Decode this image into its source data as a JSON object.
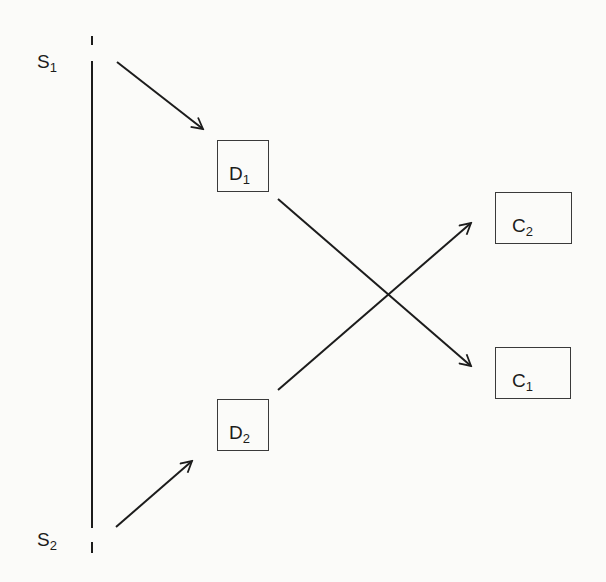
{
  "diagram": {
    "sources": [
      {
        "id": "S1",
        "letter": "S",
        "sub": "1"
      },
      {
        "id": "S2",
        "letter": "S",
        "sub": "2"
      }
    ],
    "detectors": [
      {
        "id": "D1",
        "letter": "D",
        "sub": "1"
      },
      {
        "id": "D2",
        "letter": "D",
        "sub": "2"
      }
    ],
    "counters": [
      {
        "id": "C2",
        "letter": "C",
        "sub": "2"
      },
      {
        "id": "C1",
        "letter": "C",
        "sub": "1"
      }
    ],
    "connections": [
      {
        "from": "S1",
        "to": "D1"
      },
      {
        "from": "S2",
        "to": "D2"
      },
      {
        "from": "D1",
        "to": "C1"
      },
      {
        "from": "D2",
        "to": "C2"
      }
    ],
    "colors": {
      "line": "#1c1c1c",
      "background": "#fbfbf9"
    }
  }
}
